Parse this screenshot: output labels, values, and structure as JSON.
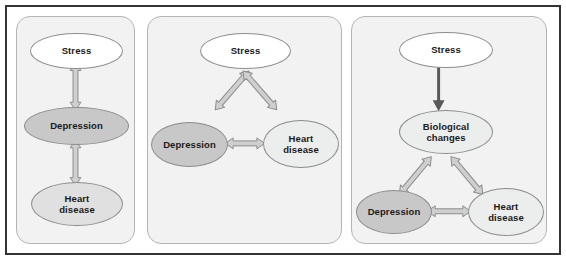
{
  "figure": {
    "panel_count": 3,
    "background_color": "#ffffff",
    "frame_color": "#343434",
    "panel_fill_color": "#f2f2f2",
    "panel_border_color": "#b4b4b4"
  },
  "node_colors": {
    "white": "#ffffff",
    "light": "#eceded",
    "mid": "#e0e0e0",
    "dark": "#c8c8c8",
    "outline": "#8d8d8d",
    "text": "#1a1a1a"
  },
  "arrow_colors": {
    "block_fill": "#cfcfcf",
    "block_stroke": "#8b8b8b",
    "thin_fill": "#595959"
  },
  "panels": [
    {
      "id": "panel-1",
      "name": "model-a-chain",
      "nodes": [
        {
          "id": "p1-stress",
          "label": "Stress",
          "lines": [
            "Stress"
          ],
          "fill": "white"
        },
        {
          "id": "p1-depression",
          "label": "Depression",
          "lines": [
            "Depression"
          ],
          "fill": "dark"
        },
        {
          "id": "p1-heart-disease",
          "label": "Heart disease",
          "lines": [
            "Heart",
            "disease"
          ],
          "fill": "mid"
        }
      ],
      "arrows": [
        {
          "from": "p1-stress",
          "to": "p1-depression",
          "style": "double-headed-block",
          "orientation": "vertical"
        },
        {
          "from": "p1-depression",
          "to": "p1-heart-disease",
          "style": "double-headed-block",
          "orientation": "vertical"
        }
      ]
    },
    {
      "id": "panel-2",
      "name": "model-b-triangle",
      "nodes": [
        {
          "id": "p2-stress",
          "label": "Stress",
          "lines": [
            "Stress"
          ],
          "fill": "white"
        },
        {
          "id": "p2-depression",
          "label": "Depression",
          "lines": [
            "Depression"
          ],
          "fill": "dark"
        },
        {
          "id": "p2-heart-disease",
          "label": "Heart disease",
          "lines": [
            "Heart",
            "disease"
          ],
          "fill": "light"
        }
      ],
      "arrows": [
        {
          "from": "p2-stress",
          "to": "p2-depression",
          "style": "double-headed-block",
          "orientation": "diagonal-left"
        },
        {
          "from": "p2-stress",
          "to": "p2-heart-disease",
          "style": "double-headed-block",
          "orientation": "diagonal-right"
        },
        {
          "from": "p2-depression",
          "to": "p2-heart-disease",
          "style": "double-headed-block",
          "orientation": "horizontal"
        }
      ]
    },
    {
      "id": "panel-3",
      "name": "model-c-mediated",
      "nodes": [
        {
          "id": "p3-stress",
          "label": "Stress",
          "lines": [
            "Stress"
          ],
          "fill": "white"
        },
        {
          "id": "p3-biological-changes",
          "label": "Biological changes",
          "lines": [
            "Biological",
            "changes"
          ],
          "fill": "light"
        },
        {
          "id": "p3-depression",
          "label": "Depression",
          "lines": [
            "Depression"
          ],
          "fill": "dark"
        },
        {
          "id": "p3-heart-disease",
          "label": "Heart disease",
          "lines": [
            "Heart",
            "disease"
          ],
          "fill": "light"
        }
      ],
      "arrows": [
        {
          "from": "p3-stress",
          "to": "p3-biological-changes",
          "style": "single-headed-thin",
          "orientation": "vertical"
        },
        {
          "from": "p3-biological-changes",
          "to": "p3-depression",
          "style": "double-headed-block",
          "orientation": "diagonal-left"
        },
        {
          "from": "p3-biological-changes",
          "to": "p3-heart-disease",
          "style": "double-headed-block",
          "orientation": "diagonal-right"
        },
        {
          "from": "p3-depression",
          "to": "p3-heart-disease",
          "style": "double-headed-block",
          "orientation": "horizontal"
        }
      ]
    }
  ]
}
